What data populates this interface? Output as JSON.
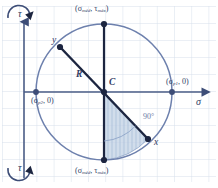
{
  "figure": {
    "type": "mohrs-circle-diagram",
    "colors": {
      "grid": "#d3ddeb",
      "axis": "#4a5c86",
      "circle": "#6d80ad",
      "diameter": "#1c2540",
      "shade_fill": "#b9c9e2",
      "text": "#2f3b63",
      "background": "#ffffff"
    },
    "axes": {
      "horizontal_label": "σ",
      "vertical_label": "τ",
      "vertical_label_top": "τ",
      "vertical_label_bottom": "τ"
    },
    "center_label": "C",
    "radius_label": "R",
    "angle_label": "90°",
    "points": [
      {
        "name": "point-y",
        "label": "y",
        "x": 60,
        "y": 47
      },
      {
        "name": "point-x",
        "label": "x",
        "x": 148,
        "y": 139
      },
      {
        "name": "point-sigma-p1",
        "label_prefix": "(σ",
        "label_sub": "p1",
        "label_suffix": ", 0)",
        "x": 172,
        "y": 92
      },
      {
        "name": "point-sigma-p2",
        "label_prefix": "(σ",
        "label_sub": "p2",
        "label_suffix": ", 0)",
        "x": 36,
        "y": 92
      },
      {
        "name": "point-tau-max-top",
        "label_prefix": "(σ",
        "label_sub": "méd",
        "label_mid": ", τ",
        "label_sub2": "máx",
        "label_suffix": ")",
        "x": 104,
        "y": 24
      },
      {
        "name": "point-tau-max-bottom",
        "label_prefix": "(σ",
        "label_sub": "méd",
        "label_mid": ", τ",
        "label_sub2": "máx",
        "label_suffix": ")",
        "x": 104,
        "y": 160
      }
    ],
    "geometry": {
      "center_x": 104,
      "center_y": 92,
      "radius": 68
    }
  }
}
